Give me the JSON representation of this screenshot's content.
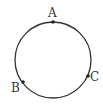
{
  "diagram": {
    "type": "circle-with-points",
    "circle": {
      "cx": 53,
      "cy": 60,
      "r": 38,
      "stroke": "#333333"
    },
    "points": [
      {
        "label": "A",
        "x": 53,
        "y": 22,
        "label_x": 48,
        "label_y": 17
      },
      {
        "label": "B",
        "x": 23,
        "y": 82,
        "label_x": 11,
        "label_y": 92
      },
      {
        "label": "C",
        "x": 88,
        "y": 76,
        "label_x": 90,
        "label_y": 81
      }
    ]
  }
}
